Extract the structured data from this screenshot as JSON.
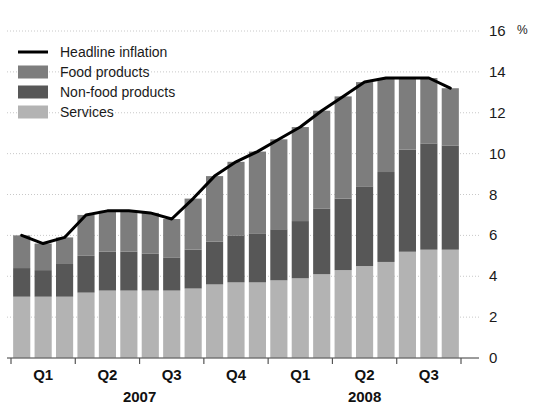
{
  "chart_data": {
    "type": "bar",
    "subtype": "stacked-bar-with-line",
    "title": "",
    "xlabel": "",
    "ylabel": "",
    "yunit": "%",
    "ylim": [
      0,
      16
    ],
    "ytick_step": 2,
    "yticks": [
      "0",
      "2",
      "4",
      "6",
      "8",
      "10",
      "12",
      "14",
      "16"
    ],
    "grid": true,
    "grid_axis": "y",
    "legend_position": "top-left",
    "x": [
      "2007-01",
      "2007-02",
      "2007-03",
      "2007-04",
      "2007-05",
      "2007-06",
      "2007-07",
      "2007-08",
      "2007-09",
      "2007-10",
      "2007-11",
      "2007-12",
      "2008-01",
      "2008-02",
      "2008-03",
      "2008-04",
      "2008-05",
      "2008-06",
      "2008-07",
      "2008-08",
      "2008-09"
    ],
    "quarter_ticks": [
      {
        "label": "Q1",
        "year": "2007",
        "start_index": 0
      },
      {
        "label": "Q2",
        "year": "2007",
        "start_index": 3
      },
      {
        "label": "Q3",
        "year": "2007",
        "start_index": 6
      },
      {
        "label": "Q4",
        "year": "2007",
        "start_index": 9
      },
      {
        "label": "Q1",
        "year": "2008",
        "start_index": 12
      },
      {
        "label": "Q2",
        "year": "2008",
        "start_index": 15
      },
      {
        "label": "Q3",
        "year": "2008",
        "start_index": 18
      }
    ],
    "year_labels": [
      {
        "label": "2007",
        "start_index": 0,
        "end_index": 11
      },
      {
        "label": "2008",
        "start_index": 12,
        "end_index": 20
      }
    ],
    "series": [
      {
        "name": "Services",
        "type": "bar",
        "stack_order": 0,
        "color": "#b3b3b3",
        "values": [
          3.0,
          3.0,
          3.0,
          3.2,
          3.3,
          3.3,
          3.3,
          3.3,
          3.4,
          3.6,
          3.7,
          3.7,
          3.8,
          3.9,
          4.1,
          4.3,
          4.5,
          4.7,
          5.2,
          5.3,
          5.3
        ]
      },
      {
        "name": "Non-food products",
        "type": "bar",
        "stack_order": 1,
        "color": "#575757",
        "values": [
          1.4,
          1.3,
          1.6,
          1.8,
          1.9,
          1.9,
          1.8,
          1.6,
          1.9,
          2.1,
          2.3,
          2.4,
          2.5,
          2.8,
          3.2,
          3.5,
          3.9,
          4.4,
          5.0,
          5.2,
          5.1
        ]
      },
      {
        "name": "Food products",
        "type": "bar",
        "stack_order": 2,
        "color": "#7d7d7d",
        "values": [
          1.6,
          1.3,
          1.3,
          2.0,
          2.0,
          2.0,
          2.0,
          1.9,
          2.5,
          3.2,
          3.6,
          4.0,
          4.4,
          4.6,
          4.8,
          5.0,
          5.1,
          4.6,
          3.5,
          3.2,
          2.8
        ]
      },
      {
        "name": "Headline inflation",
        "type": "line",
        "color": "#000000",
        "values": [
          6.0,
          5.6,
          5.9,
          7.0,
          7.2,
          7.2,
          7.1,
          6.8,
          7.8,
          8.9,
          9.6,
          10.1,
          10.7,
          11.3,
          12.1,
          12.8,
          13.5,
          13.7,
          13.7,
          13.7,
          13.2
        ]
      }
    ]
  },
  "legend": {
    "items": [
      {
        "label": "Headline inflation",
        "marker": "line",
        "color": "#000000"
      },
      {
        "label": "Food products",
        "marker": "swatch",
        "color": "#7d7d7d"
      },
      {
        "label": "Non-food products",
        "marker": "swatch",
        "color": "#575757"
      },
      {
        "label": "Services",
        "marker": "swatch",
        "color": "#b3b3b3"
      }
    ]
  },
  "axis": {
    "unit_label": "%",
    "tick_labels": [
      "16",
      "14",
      "12",
      "10",
      "8",
      "6",
      "4",
      "2",
      "0"
    ]
  },
  "colors": {
    "background": "#ffffff",
    "gridline": "#c8c8c8",
    "axis": "#555555",
    "text": "#1a1a1a"
  }
}
